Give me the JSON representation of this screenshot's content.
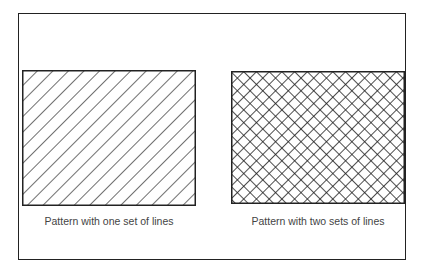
{
  "figure": {
    "panels": [
      {
        "id": "single",
        "caption": "Pattern with one set of lines",
        "pattern": "diagonal-hatch",
        "line_sets": 1
      },
      {
        "id": "double",
        "caption": "Pattern with two sets of lines",
        "pattern": "cross-hatch",
        "line_sets": 2
      }
    ],
    "colors": {
      "line": "#222222",
      "background": "#ffffff",
      "caption": "#444444"
    }
  }
}
